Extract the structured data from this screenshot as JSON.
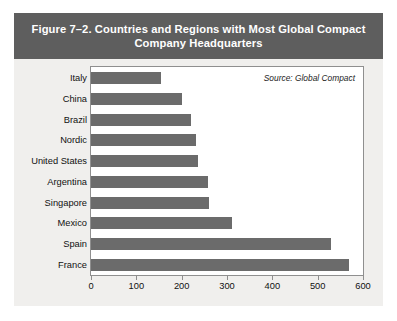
{
  "figure": {
    "title": "Figure 7–2. Countries and Regions with Most Global Compact Company Headquarters",
    "title_line1": "Figure 7–2. Countries and Regions with Most Global Compact",
    "title_line2": "Company Headquarters",
    "title_band_color": "#5e5e5e",
    "background_color": "#f0efed",
    "plot_background_color": "#ffffff"
  },
  "chart_data": {
    "type": "bar",
    "orientation": "horizontal",
    "title": "Figure 7–2. Countries and Regions with Most Global Compact Company Headquarters",
    "categories": [
      "Italy",
      "China",
      "Brazil",
      "Nordic",
      "United States",
      "Argentina",
      "Singapore",
      "Mexico",
      "Spain",
      "France"
    ],
    "values": [
      155,
      200,
      220,
      232,
      235,
      258,
      260,
      310,
      530,
      570
    ],
    "series": [
      {
        "name": "Global Compact company headquarters",
        "values": [
          155,
          200,
          220,
          232,
          235,
          258,
          260,
          310,
          530,
          570
        ],
        "color": "#6b6b6b"
      }
    ],
    "xlabel": "",
    "ylabel": "",
    "xlim": [
      0,
      600
    ],
    "xticks": [
      0,
      100,
      200,
      300,
      400,
      500,
      600
    ],
    "xtick_labels": [
      "0",
      "100",
      "200",
      "300",
      "400",
      "500",
      "600"
    ],
    "grid": false,
    "legend": false,
    "annotations": [
      {
        "text": "Source: Global Compact",
        "position": "top-right",
        "style": "italic"
      }
    ]
  }
}
